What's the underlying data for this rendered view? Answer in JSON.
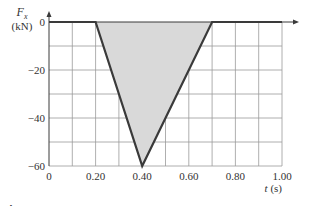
{
  "chart_data": {
    "type": "area",
    "title": "",
    "ylabel_symbol": "F",
    "ylabel_sub": "x",
    "ylabel_unit": "(kN)",
    "xlabel": "t (s)",
    "xlabel_var": "t",
    "xlabel_unit": "(s)",
    "xlim": [
      0,
      1.0
    ],
    "ylim": [
      -60,
      0
    ],
    "x_ticks": [
      0,
      0.2,
      0.4,
      0.6,
      0.8,
      1.0
    ],
    "x_tick_labels": [
      "0",
      "0.20",
      "0.40",
      "0.60",
      "0.80",
      "1.00"
    ],
    "y_ticks": [
      0,
      -20,
      -40,
      -60
    ],
    "y_tick_labels": [
      "0",
      "−20",
      "−40",
      "−60"
    ],
    "grid": true,
    "grid_x_step": 0.1,
    "grid_y_step": 10,
    "series": [
      {
        "name": "Fx",
        "x": [
          0,
          0.2,
          0.4,
          0.7,
          1.0
        ],
        "y": [
          0,
          0,
          -60,
          0,
          0
        ]
      }
    ],
    "shaded_region": {
      "x": [
        0.2,
        0.4,
        0.7
      ],
      "y": [
        0,
        -60,
        0
      ],
      "fill": "#d9d9d9"
    },
    "caption": "Figure 7.7"
  },
  "colors": {
    "line": "#3a3a3a",
    "grid": "#9a9a9a",
    "fill": "#d9d9d9",
    "text": "#333333"
  }
}
